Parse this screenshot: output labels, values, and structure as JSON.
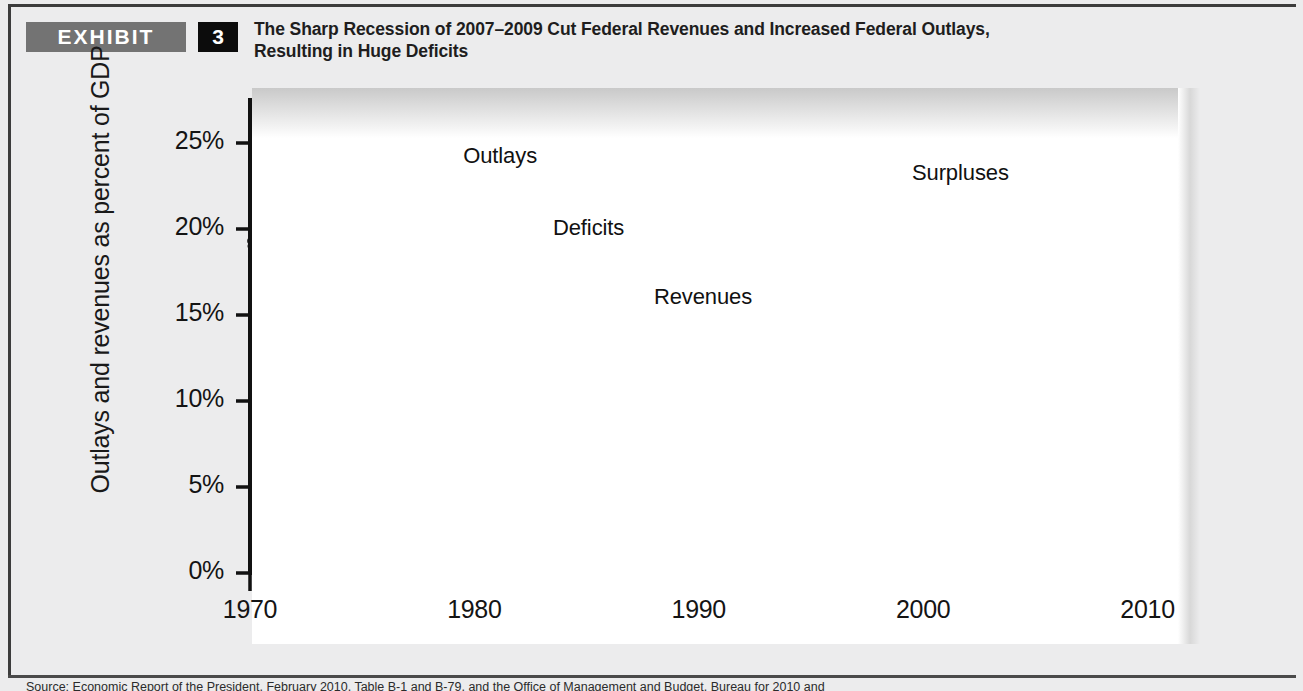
{
  "header": {
    "exhibit_tag": "EXHIBIT",
    "exhibit_number": "3",
    "title_line1": "The Sharp Recession of 2007–2009 Cut Federal Revenues and Increased Federal Outlays,",
    "title_line2": "Resulting in Huge Deficits"
  },
  "source": {
    "text": "Source: Economic Report of the President, February 2010, Table B-1 and B-79, and the Office of Management and Budget, Bureau for 2010 and"
  },
  "colors": {
    "panel_background": "#ececed",
    "plot_background": "#ffffff",
    "deficit_fill": "#a8a8a8",
    "surplus_fill": "#c6c6c6",
    "outlays_line": "#3d3d3d",
    "revenues_line": "#7b7b7b",
    "exhibit_tag_bg": "#737373",
    "exhibit_number_bg": "#0c0c0c",
    "axis": "#111111"
  },
  "chart_data": {
    "type": "area",
    "title": "The Sharp Recession of 2007–2009 Cut Federal Revenues and Increased Federal Outlays, Resulting in Huge Deficits",
    "xlabel": "",
    "ylabel": "Outlays and revenues as percent of GDP",
    "xlim": [
      1970,
      2011
    ],
    "ylim": [
      0,
      26
    ],
    "grid": false,
    "legend_position": "inline-annotations",
    "y_ticks": [
      "0%",
      "5%",
      "10%",
      "15%",
      "20%",
      "25%"
    ],
    "y_tick_values": [
      0,
      5,
      10,
      15,
      20,
      25
    ],
    "x_ticks": [
      "1970",
      "1980",
      "1990",
      "2000",
      "2010"
    ],
    "x_tick_values": [
      1970,
      1980,
      1990,
      2000,
      2010
    ],
    "x_minor_tick_interval": 1,
    "annotations": [
      {
        "label": "Outlays",
        "x": 1979.5,
        "y": 24.2
      },
      {
        "label": "Deficits",
        "x": 1983.5,
        "y": 20.0
      },
      {
        "label": "Revenues",
        "x": 1988.0,
        "y": 16.0
      },
      {
        "label": "Surpluses",
        "x": 1999.5,
        "y": 23.2,
        "has_leader_line": true
      }
    ],
    "x": [
      1970,
      1971,
      1972,
      1973,
      1974,
      1975,
      1976,
      1977,
      1978,
      1979,
      1980,
      1981,
      1982,
      1983,
      1984,
      1985,
      1986,
      1987,
      1988,
      1989,
      1990,
      1991,
      1992,
      1993,
      1994,
      1995,
      1996,
      1997,
      1998,
      1999,
      2000,
      2001,
      2002,
      2003,
      2004,
      2005,
      2006,
      2007,
      2008,
      2009,
      2010,
      2011
    ],
    "series": [
      {
        "name": "Outlays",
        "values": [
          19.3,
          19.4,
          19.6,
          18.7,
          18.7,
          21.3,
          21.4,
          20.7,
          20.7,
          20.1,
          21.7,
          22.2,
          23.1,
          23.5,
          22.2,
          22.8,
          22.5,
          21.6,
          21.3,
          21.2,
          21.8,
          22.3,
          22.1,
          21.4,
          21.0,
          20.6,
          20.2,
          19.5,
          19.1,
          18.5,
          18.2,
          18.2,
          19.1,
          19.7,
          19.6,
          19.9,
          20.1,
          19.6,
          20.7,
          24.7,
          24.3,
          25.0
        ]
      },
      {
        "name": "Revenues",
        "values": [
          19.0,
          17.3,
          17.6,
          17.6,
          18.3,
          17.9,
          17.1,
          18.0,
          18.0,
          18.5,
          19.0,
          19.6,
          19.2,
          17.5,
          17.3,
          17.7,
          17.5,
          18.4,
          18.2,
          18.4,
          18.0,
          17.8,
          17.5,
          17.6,
          18.1,
          18.5,
          18.9,
          19.3,
          19.9,
          20.0,
          20.6,
          19.5,
          17.6,
          16.2,
          16.1,
          17.3,
          18.2,
          18.5,
          17.5,
          14.8,
          14.6,
          15.7
        ]
      }
    ],
    "regions": [
      {
        "name": "Deficits",
        "description": "area where outlays exceed revenues",
        "fill": "#a8a8a8"
      },
      {
        "name": "Surpluses",
        "description": "area where revenues exceed outlays (1998–2001)",
        "fill": "#c6c6c6"
      }
    ]
  }
}
